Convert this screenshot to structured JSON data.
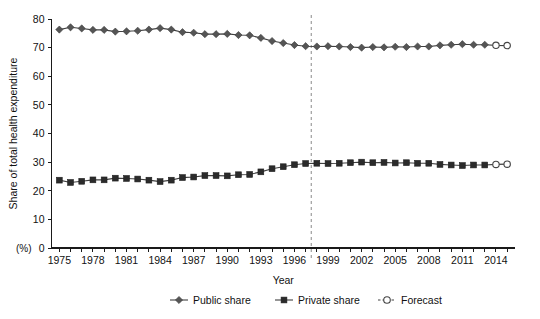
{
  "chart_data": {
    "type": "line",
    "title": "",
    "xlabel": "Year",
    "ylabel": "Share of total health expenditure",
    "yunit": "(%)",
    "xlim": [
      1974.3,
      2015.7
    ],
    "ylim": [
      0,
      80
    ],
    "yticks": [
      0,
      10,
      20,
      30,
      40,
      50,
      60,
      70,
      80
    ],
    "ytick_labels": [
      "0",
      "10",
      "20",
      "30",
      "40",
      "50",
      "60",
      "70",
      "80"
    ],
    "grid": false,
    "legend_position": "bottom",
    "x": [
      1975,
      1976,
      1977,
      1978,
      1979,
      1980,
      1981,
      1982,
      1983,
      1984,
      1985,
      1986,
      1987,
      1988,
      1989,
      1990,
      1991,
      1992,
      1993,
      1994,
      1995,
      1996,
      1997,
      1998,
      1999,
      2000,
      2001,
      2002,
      2003,
      2004,
      2005,
      2006,
      2007,
      2008,
      2009,
      2010,
      2011,
      2012,
      2013,
      2014,
      2015
    ],
    "xtick_years": [
      1975,
      1976,
      1977,
      1978,
      1979,
      1980,
      1981,
      1982,
      1983,
      1984,
      1985,
      1986,
      1987,
      1988,
      1989,
      1990,
      1991,
      1992,
      1993,
      1994,
      1995,
      1996,
      1997,
      1998,
      1999,
      2000,
      2001,
      2002,
      2003,
      2004,
      2005,
      2006,
      2007,
      2008,
      2009,
      2010,
      2011,
      2012,
      2013,
      2014,
      2015
    ],
    "xtick_labels": [
      {
        "year": 1975,
        "label": "1975"
      },
      {
        "year": 1978,
        "label": "1978"
      },
      {
        "year": 1981,
        "label": "1981"
      },
      {
        "year": 1984,
        "label": "1984"
      },
      {
        "year": 1987,
        "label": "1987"
      },
      {
        "year": 1990,
        "label": "1990"
      },
      {
        "year": 1993,
        "label": "1993"
      },
      {
        "year": 1996,
        "label": "1996"
      },
      {
        "year": 1999,
        "label": "1999"
      },
      {
        "year": 2002,
        "label": "2002"
      },
      {
        "year": 2005,
        "label": "2005"
      },
      {
        "year": 2008,
        "label": "2008"
      },
      {
        "year": 2011,
        "label": "2011"
      },
      {
        "year": 2014,
        "label": "2014"
      }
    ],
    "forecast_divider_x": 1997.5,
    "forecast_start_year": 2014,
    "series": [
      {
        "name": "Public share",
        "marker": "diamond",
        "values": [
          76.3,
          77.1,
          76.7,
          76.2,
          76.2,
          75.6,
          75.7,
          75.9,
          76.3,
          76.8,
          76.3,
          75.4,
          75.2,
          74.7,
          74.7,
          74.8,
          74.4,
          74.3,
          73.4,
          72.3,
          71.6,
          70.9,
          70.5,
          70.4,
          70.5,
          70.4,
          70.2,
          70.0,
          70.2,
          70.1,
          70.3,
          70.2,
          70.4,
          70.4,
          70.8,
          71.0,
          71.2,
          71.0,
          71.0,
          70.8,
          70.7
        ]
      },
      {
        "name": "Private share",
        "marker": "square",
        "values": [
          23.7,
          22.9,
          23.3,
          23.8,
          23.8,
          24.4,
          24.3,
          24.1,
          23.7,
          23.2,
          23.7,
          24.6,
          24.8,
          25.3,
          25.3,
          25.2,
          25.6,
          25.7,
          26.6,
          27.7,
          28.4,
          29.1,
          29.5,
          29.6,
          29.5,
          29.6,
          29.8,
          30.0,
          29.8,
          29.9,
          29.7,
          29.8,
          29.6,
          29.6,
          29.2,
          29.0,
          28.8,
          29.0,
          29.0,
          29.2,
          29.3
        ]
      }
    ],
    "legend": [
      {
        "label": "Public share",
        "marker": "diamond",
        "style": "solid"
      },
      {
        "label": "Private share",
        "marker": "square",
        "style": "solid"
      },
      {
        "label": "Forecast",
        "marker": "circle-hollow",
        "style": "dashed"
      }
    ]
  }
}
